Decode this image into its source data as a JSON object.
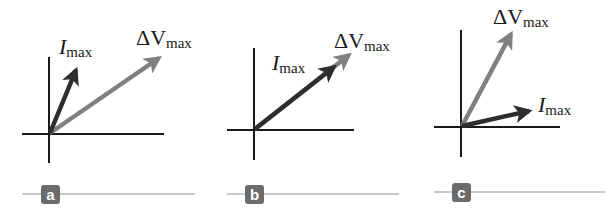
{
  "figure": {
    "colors": {
      "current_arrow": "#2e2e2e",
      "voltage_arrow": "#808080",
      "axes": "#1a1a1a",
      "badge_bg": "#6b6b6b",
      "rule": "#c8c8c8"
    },
    "panels": [
      {
        "id": "a",
        "label": "a",
        "current_label": "I",
        "current_sub": "max",
        "voltage_label": "ΔV",
        "voltage_sub": "max",
        "relationship": "current leads voltage"
      },
      {
        "id": "b",
        "label": "b",
        "current_label": "I",
        "current_sub": "max",
        "voltage_label": "ΔV",
        "voltage_sub": "max",
        "relationship": "current in phase with voltage"
      },
      {
        "id": "c",
        "label": "c",
        "current_label": "I",
        "current_sub": "max",
        "voltage_label": "ΔV",
        "voltage_sub": "max",
        "relationship": "current lags voltage"
      }
    ]
  }
}
